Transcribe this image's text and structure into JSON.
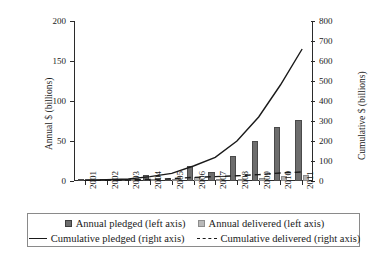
{
  "chart_data": {
    "type": "bar",
    "title": "",
    "xlabel": "",
    "ylabel": "Annual $ (billions)",
    "y2label": "Cumulative $ (billions)",
    "ylim": [
      0,
      200
    ],
    "y2lim": [
      0,
      800
    ],
    "grid": false,
    "legend_position": "bottom",
    "categories": [
      "2001",
      "2002",
      "2003",
      "2004",
      "2005",
      "2006",
      "2007",
      "2008",
      "2009",
      "2010",
      "2011"
    ],
    "yticks": [
      "0",
      "50",
      "100",
      "150",
      "200"
    ],
    "y2ticks": [
      "0",
      "100",
      "200",
      "300",
      "400",
      "500",
      "600",
      "700",
      "800"
    ],
    "series": [
      {
        "name": "Annual pledged (left axis)",
        "axis": "left",
        "kind": "bar",
        "color": "#6d6d6d",
        "values": [
          1,
          0.5,
          1,
          8,
          3,
          19,
          11,
          31,
          50,
          67,
          76
        ]
      },
      {
        "name": "Annual delivered (left axis)",
        "axis": "left",
        "kind": "bar",
        "color": "#b4b4b4",
        "values": [
          0.3,
          0.3,
          0.5,
          0.5,
          2,
          4.5,
          2,
          2.5,
          4,
          6.5,
          7
        ]
      },
      {
        "name": "Cumulative pledged (right axis)",
        "axis": "right",
        "kind": "line",
        "style": "solid",
        "color": "#1a1a1a",
        "values": [
          4,
          6,
          10,
          22,
          38,
          75,
          118,
          200,
          320,
          480,
          660
        ]
      },
      {
        "name": "Cumulative delivered (right axis)",
        "axis": "right",
        "kind": "line",
        "style": "dashed",
        "color": "#1a1a1a",
        "values": [
          2,
          3,
          5,
          8,
          12,
          18,
          22,
          26,
          32,
          40,
          45
        ]
      }
    ]
  },
  "axes": {
    "left_title": "Annual $ (billions)",
    "right_title": "Cumulative $ (billions)"
  },
  "legend": {
    "items": [
      {
        "label": "Annual pledged (left axis)",
        "marker": "square-dark-icon"
      },
      {
        "label": "Annual delivered (left axis)",
        "marker": "square-light-icon"
      },
      {
        "label": "Cumulative pledged (right axis)",
        "marker": "solid-line-icon"
      },
      {
        "label": "Cumulative delivered (right axis)",
        "marker": "dashed-line-icon"
      }
    ]
  }
}
